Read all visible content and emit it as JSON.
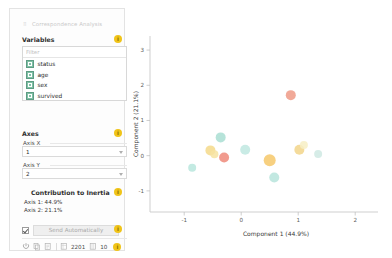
{
  "window": {
    "title": "Correspondence Analysis"
  },
  "variables": {
    "header": "Variables",
    "filter_placeholder": "Filter",
    "filter_value": "",
    "items": [
      {
        "label": "status",
        "color": "#7fc1a6"
      },
      {
        "label": "age",
        "color": "#7fc1a6"
      },
      {
        "label": "sex",
        "color": "#7fc1a6"
      },
      {
        "label": "survived",
        "color": "#7fc1a6"
      }
    ]
  },
  "axes": {
    "header": "Axes",
    "x_label": "Axis X",
    "x_value": "1",
    "y_label": "Axis Y",
    "y_value": "2"
  },
  "contribution": {
    "header": "Contribution to Inertia",
    "axis1": "Axis 1: 44.9%",
    "axis2": "Axis 2: 21.1%"
  },
  "footer": {
    "send_label": "Send Automatically",
    "send_checked": true,
    "instances": "2201",
    "features": "10",
    "icons": [
      "power-icon",
      "copy-icon",
      "report-icon",
      "instances-icon",
      "features-icon",
      "help-icon"
    ]
  },
  "info_badges": {
    "variables": "i",
    "axes": "i",
    "contribution": "i",
    "send": "i",
    "status": "i"
  },
  "chart_data": {
    "type": "scatter",
    "title": "",
    "xlabel": "Component 1 (44.9%)",
    "ylabel": "Component 2 (21.1%)",
    "xlim": [
      -1.6,
      2.4
    ],
    "ylim": [
      -1.6,
      3.4
    ],
    "xticks": [
      -1,
      0,
      1,
      2
    ],
    "yticks": [
      -1,
      0,
      1,
      2,
      3
    ],
    "grid": false,
    "legend": "none",
    "points": [
      {
        "x": -0.86,
        "y": -0.34,
        "color": "#b8e6dd",
        "label": "",
        "size": 4
      },
      {
        "x": -0.54,
        "y": 0.15,
        "color": "#f5d98a",
        "label": "",
        "size": 5
      },
      {
        "x": -0.47,
        "y": 0.04,
        "color": "#f7e3a1",
        "label": "",
        "size": 4
      },
      {
        "x": -0.36,
        "y": 0.52,
        "color": "#a9ded2",
        "label": "",
        "size": 5
      },
      {
        "x": -0.3,
        "y": -0.05,
        "color": "#ef8a7a",
        "label": "",
        "size": 5
      },
      {
        "x": 0.07,
        "y": 0.17,
        "color": "#bfe7e0",
        "label": "",
        "size": 5
      },
      {
        "x": 0.5,
        "y": -0.13,
        "color": "#f6c86a",
        "label": "",
        "size": 6
      },
      {
        "x": 0.58,
        "y": -0.62,
        "color": "#b7e4dc",
        "label": "",
        "size": 5
      },
      {
        "x": 0.87,
        "y": 1.72,
        "color": "#ef9a86",
        "label": "",
        "size": 5
      },
      {
        "x": 1.02,
        "y": 0.17,
        "color": "#f2d589",
        "label": "",
        "size": 5
      },
      {
        "x": 1.1,
        "y": 0.3,
        "color": "#f7eec4",
        "label": "",
        "size": 4
      },
      {
        "x": 1.35,
        "y": 0.05,
        "color": "#cfe9e3",
        "label": "",
        "size": 4
      }
    ]
  }
}
